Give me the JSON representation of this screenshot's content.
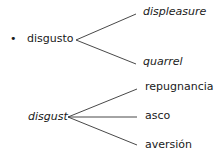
{
  "diagram": {
    "group1": {
      "bullet": "•",
      "source": "disgusto",
      "targets": [
        "displeasure",
        "quarrel"
      ]
    },
    "group2": {
      "source": "disgust",
      "targets": [
        "repugnancia",
        "asco",
        "aversión"
      ]
    },
    "colors": {
      "text": "#1a1a1a",
      "line": "#333333",
      "background": "#ffffff"
    }
  }
}
